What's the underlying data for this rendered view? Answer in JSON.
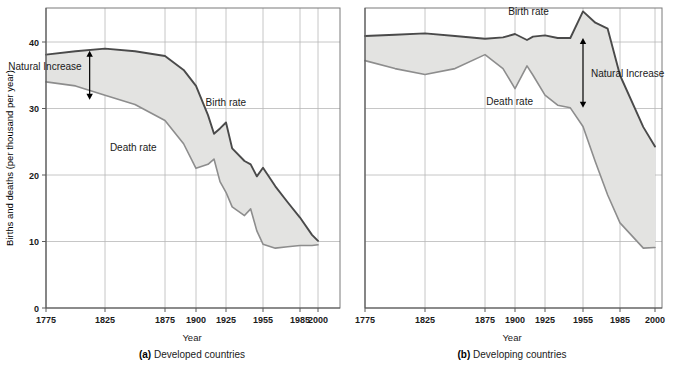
{
  "figure": {
    "ylabel": "Births and deaths (per thousand per year)",
    "xlabel_a": "Year",
    "xlabel_b": "Year",
    "caption_a_prefix": "(a)",
    "caption_a_text": " Developed countries",
    "caption_b_prefix": "(b)",
    "caption_b_text": " Developing countries",
    "colors": {
      "band_fill": "#e3e3e1",
      "birth_line": "#4a4a4a",
      "death_line": "#8d8d8d",
      "gridline": "#b8b8b8",
      "frame": "#7a7a7a",
      "text": "#1a1a1a"
    }
  },
  "chart_data": [
    {
      "type": "area",
      "panel": "a",
      "title": "(a) Developed countries",
      "xlabel": "Year",
      "ylabel": "Births and deaths (per thousand per year)",
      "xticks": [
        1775,
        1825,
        1875,
        1900,
        1925,
        1955,
        1985,
        2000
      ],
      "xtick_labels": [
        "1775",
        "1825",
        "1875",
        "1900",
        "1925",
        "1955",
        "1985",
        "2000"
      ],
      "yticks": [
        0,
        10,
        20,
        30,
        40
      ],
      "ytick_labels": [
        "0",
        "10",
        "20",
        "30",
        "40"
      ],
      "ylim": [
        0,
        45
      ],
      "grid": true,
      "legend": "inline-labels",
      "annotations": [
        {
          "text": "Natural Increase",
          "x": 1812,
          "y_top": 38.7,
          "y_bottom": 31.3
        },
        {
          "text": "Birth rate",
          "x": 1908,
          "y": 30.4
        },
        {
          "text": "Death rate",
          "x": 1868,
          "y": 23.6
        }
      ],
      "series": [
        {
          "name": "Birth rate",
          "x": [
            1775,
            1800,
            1825,
            1850,
            1875,
            1890,
            1900,
            1910,
            1915,
            1920,
            1925,
            1930,
            1940,
            1945,
            1950,
            1955,
            1965,
            1975,
            1985,
            1995,
            2000
          ],
          "values": [
            38.1,
            38.6,
            39.0,
            38.6,
            37.9,
            35.8,
            33.4,
            29.0,
            26.2,
            27.0,
            27.9,
            24.0,
            22.1,
            21.6,
            19.8,
            21.1,
            18.3,
            15.9,
            13.6,
            11.0,
            10.1
          ]
        },
        {
          "name": "Death rate",
          "x": [
            1775,
            1800,
            1825,
            1850,
            1875,
            1890,
            1900,
            1910,
            1915,
            1920,
            1925,
            1930,
            1940,
            1945,
            1950,
            1955,
            1965,
            1975,
            1985,
            1995,
            2000
          ],
          "values": [
            34.0,
            33.4,
            32.0,
            30.6,
            28.2,
            24.7,
            21.0,
            21.6,
            22.4,
            19.0,
            17.4,
            15.2,
            13.9,
            14.9,
            11.6,
            9.6,
            9.0,
            9.2,
            9.4,
            9.4,
            9.5
          ]
        }
      ]
    },
    {
      "type": "area",
      "panel": "b",
      "title": "(b) Developing countries",
      "xlabel": "Year",
      "ylabel": "Births and deaths (per thousand per year)",
      "xticks": [
        1775,
        1825,
        1875,
        1900,
        1925,
        1955,
        1985,
        2000
      ],
      "xtick_labels": [
        "1775",
        "1825",
        "1875",
        "1900",
        "1925",
        "1955",
        "1985",
        "2000"
      ],
      "yticks": [
        0,
        10,
        20,
        30,
        40
      ],
      "ytick_labels": [
        "0",
        "10",
        "20",
        "30",
        "40"
      ],
      "ylim": [
        0,
        45
      ],
      "grid": true,
      "legend": "inline-labels",
      "annotations": [
        {
          "text": "Birth rate",
          "x": 1928,
          "y": 44.0
        },
        {
          "text": "Natural Increase",
          "x": 1955,
          "y_top": 40.6,
          "y_bottom": 30.1
        },
        {
          "text": "Death rate",
          "x": 1915,
          "y": 30.5
        }
      ],
      "series": [
        {
          "name": "Birth rate",
          "x": [
            1775,
            1800,
            1825,
            1850,
            1875,
            1890,
            1900,
            1910,
            1915,
            1925,
            1935,
            1945,
            1955,
            1965,
            1975,
            1985,
            1995,
            2000
          ],
          "values": [
            40.9,
            41.1,
            41.3,
            40.9,
            40.5,
            40.7,
            41.2,
            40.3,
            40.8,
            41.0,
            40.6,
            40.6,
            44.6,
            42.9,
            42.0,
            35.0,
            27.2,
            24.3
          ]
        },
        {
          "name": "Death rate",
          "x": [
            1775,
            1800,
            1825,
            1850,
            1875,
            1890,
            1900,
            1910,
            1915,
            1925,
            1935,
            1945,
            1955,
            1965,
            1975,
            1985,
            1995,
            2000
          ],
          "values": [
            37.2,
            36.0,
            35.1,
            36.0,
            38.1,
            36.0,
            33.0,
            36.4,
            35.0,
            32.0,
            30.5,
            30.1,
            27.3,
            22.0,
            17.0,
            12.8,
            9.0,
            9.1
          ]
        }
      ]
    }
  ]
}
